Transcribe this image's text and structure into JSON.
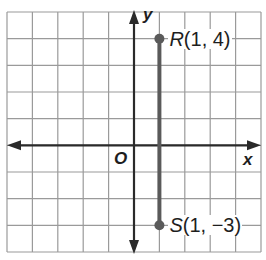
{
  "diagram": {
    "type": "coordinate-plane",
    "grid": {
      "x_min": -5,
      "x_max": 5,
      "y_min": -4,
      "y_max": 5,
      "step": 1
    },
    "axes": {
      "x_label": "x",
      "y_label": "y",
      "origin_label": "O"
    },
    "points": [
      {
        "name": "R",
        "x": 1,
        "y": 4,
        "coords_text": "(1, 4)"
      },
      {
        "name": "S",
        "x": 1,
        "y": -3,
        "coords_text": "(1, −3)"
      }
    ],
    "segment": {
      "from": "R",
      "to": "S"
    },
    "colors": {
      "grid": "#9a9a9a",
      "axis": "#2a2a2a",
      "segment": "#5a5a5a",
      "text": "#1e1e1e"
    }
  }
}
